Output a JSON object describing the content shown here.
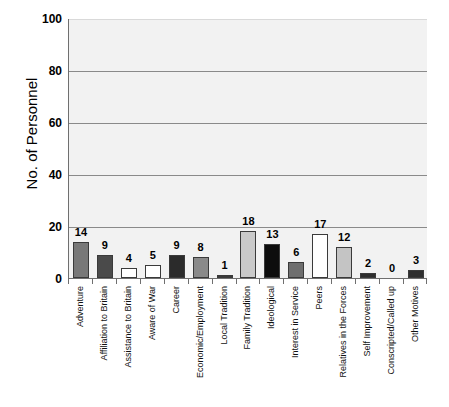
{
  "chart_data": {
    "type": "bar",
    "title": "",
    "xlabel": "",
    "ylabel": "No. of Personnel",
    "ylim": [
      0,
      100
    ],
    "yticks": [
      0,
      20,
      40,
      60,
      80,
      100
    ],
    "grid": true,
    "legend": "none",
    "categories": [
      "Adventure",
      "Affiliation to Britain",
      "Assistance to Britain",
      "Aware of War",
      "Career",
      "Economic/Employment",
      "Local Tradition",
      "Family Tradition",
      "Ideological",
      "Interest in Service",
      "Peers",
      "Relatives in the Forces",
      "Self Improvement",
      "Conscripted/Called up",
      "Other Motives"
    ],
    "values": [
      14,
      9,
      4,
      5,
      9,
      8,
      1,
      18,
      13,
      6,
      17,
      12,
      2,
      0,
      3
    ],
    "bar_colors": [
      "#787878",
      "#4a4a4a",
      "#ffffff",
      "#ffffff",
      "#2b2b2b",
      "#8a8a8a",
      "#3a3a3a",
      "#c9c9c9",
      "#0d0d0d",
      "#6e6e6e",
      "#ffffff",
      "#c4c4c4",
      "#2e2e2e",
      "#2e2e2e",
      "#2e2e2e"
    ],
    "data_labels": [
      "14",
      "9",
      "4",
      "5",
      "9",
      "8",
      "1",
      "18",
      "13",
      "6",
      "17",
      "12",
      "2",
      "0",
      "3"
    ],
    "ytick_labels": [
      "0",
      "20",
      "40",
      "60",
      "80",
      "100"
    ]
  },
  "style": {
    "plot_background": "#f2f2f2",
    "gridline_color": "#8a8a8a",
    "axis_color": "#6f6f6f",
    "text_color": "#000000"
  }
}
